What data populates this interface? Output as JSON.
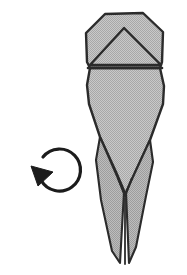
{
  "figure": {
    "kind": "origami-diagram",
    "title": "Origami step diagram: tapered flap model with rotate arrow",
    "background_color": "#ffffff",
    "stroke_color": "#2b2b2b",
    "fill_color": "#bdbdbd",
    "fill_color_shadow": "#adadad",
    "canvas": {
      "width": 187,
      "height": 275
    }
  },
  "model": {
    "name": "paper-model",
    "upper_panel": {
      "name": "upper-hexagon-panel",
      "description": "Top hexagonal panel of folded paper",
      "points": "105,14 143,13 163,32 162,62 160,68 90,68 87,62 86,33"
    },
    "crease_triangle": {
      "name": "center-crease-triangle",
      "description": "Inner triangular crease inside the upper panel",
      "apex": "124,28",
      "points": "124,28 161,65 90,65"
    },
    "crease_line_horizontal": {
      "name": "horizontal-crease-line",
      "from": "88,68",
      "to": "162,68"
    },
    "lower_panel": {
      "name": "lower-tapered-panel",
      "description": "Lower body tapering to a narrow point",
      "points": "90,68 160,68 164,86 163,104 150,140 133,177 126,196 122,186 116,172 100,137 89,104 87,85"
    },
    "left_spike": {
      "name": "left-spike-flap",
      "points": "100,137 124,192 120,263 112,251 101,200 96,160"
    },
    "right_spike": {
      "name": "right-spike-flap",
      "points": "150,140 126,192 129,263 136,247 146,196 153,162"
    },
    "inner_notch": {
      "name": "center-notch-crease",
      "description": "V shaped notch where the two spikes meet",
      "points": "118,178 125,196 132,178"
    },
    "tail_slit": {
      "name": "tail-center-slit",
      "from": "125,196",
      "to": "125,264"
    }
  },
  "annotations": {
    "rotate_arrow": {
      "name": "rotate-counterclockwise-arrow",
      "description": "Curved circular arrow indicating counterclockwise rotation",
      "center_x": 57,
      "center_y": 172,
      "radius": 21,
      "arc_path": "M 43 157 A 21 21 0 1 1 41 180",
      "head_points": "31,166 53,172 38,186",
      "color": "#1c1c1c"
    }
  }
}
